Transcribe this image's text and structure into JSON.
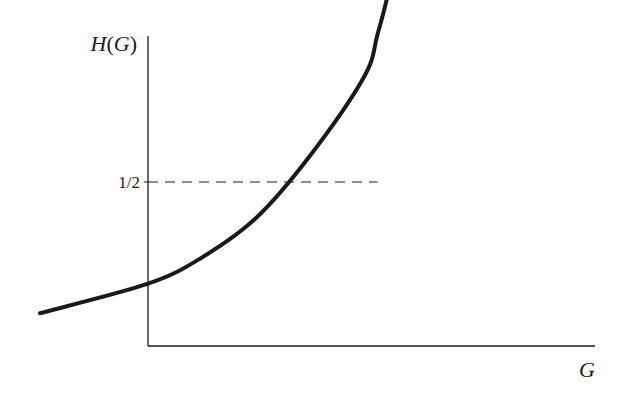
{
  "chart_data": {
    "type": "line",
    "title": "",
    "xlabel": "G",
    "ylabel": "H(G)",
    "ylabel_parts": {
      "func": "H",
      "open": "(",
      "arg": "G",
      "close": ")"
    },
    "yticks": [
      {
        "value": 0.5,
        "label": "1/2"
      }
    ],
    "xticks": [],
    "xlim": [
      -0.2,
      0.84
    ],
    "ylim": [
      0,
      1
    ],
    "grid": false,
    "legend": "none",
    "series": [
      {
        "name": "H(G)",
        "style": "solid",
        "color": "#1a1a1a",
        "x": [
          -0.2,
          0.0,
          0.1,
          0.2,
          0.3,
          0.4,
          0.425,
          0.45,
          0.475,
          0.5,
          0.55,
          0.6,
          0.7,
          0.8
        ],
        "y": [
          0.1,
          0.19,
          0.27,
          0.39,
          0.58,
          0.82,
          0.95,
          1.12,
          1.42,
          1.48,
          1.58,
          1.65,
          1.73,
          1.8
        ]
      }
    ],
    "annotations": [
      {
        "type": "dashed-guide",
        "y": 0.5,
        "x_end": 0.425,
        "color": "#1a1a1a"
      }
    ]
  }
}
